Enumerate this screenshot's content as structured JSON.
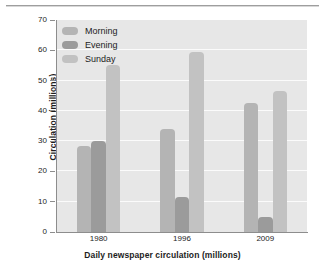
{
  "chart_data": {
    "type": "bar",
    "title": "",
    "xlabel": "Daily newspaper circulation (millions)",
    "ylabel": "Circulation (millions)",
    "categories": [
      "1980",
      "1996",
      "2009"
    ],
    "series": [
      {
        "name": "Morning",
        "values": [
          28.5,
          34.0,
          42.5
        ],
        "color": "#b4b4b4"
      },
      {
        "name": "Evening",
        "values": [
          30.0,
          11.5,
          5.0
        ],
        "color": "#9b9b9b"
      },
      {
        "name": "Sunday",
        "values": [
          55.0,
          59.5,
          46.5
        ],
        "color": "#c2c2c2"
      }
    ],
    "ylim": [
      0,
      70
    ],
    "yticks": [
      0,
      10,
      20,
      30,
      40,
      50,
      60,
      70
    ],
    "ytick_labels": [
      "0",
      "10",
      "20",
      "30",
      "40",
      "50",
      "60",
      "70"
    ],
    "grid": true,
    "legend_position": "upper-left",
    "plot_background": "#e7e7e7",
    "gridline_color": "#fbfbfb",
    "axis_color": "#8d8d8d"
  },
  "legend": {
    "items": [
      {
        "label": "Morning"
      },
      {
        "label": "Evening"
      },
      {
        "label": "Sunday"
      }
    ]
  }
}
